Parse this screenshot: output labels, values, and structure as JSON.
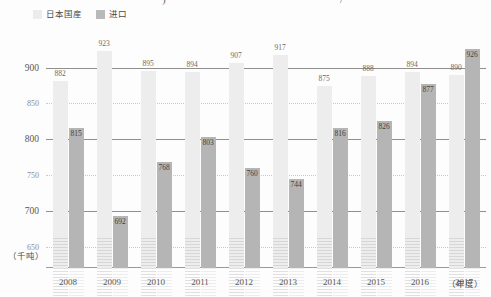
{
  "title_fragments": {
    "left": ")",
    "right": "/"
  },
  "legend": {
    "position": "top-left",
    "items": [
      {
        "label": "日本国産",
        "color": "#ececec",
        "key": "domestic"
      },
      {
        "label": "进口",
        "color": "#b9b9b9",
        "key": "import"
      }
    ]
  },
  "units": {
    "y": "（千吨）",
    "x": "（年度）"
  },
  "chart_data": {
    "type": "bar",
    "title": "",
    "subtitle": "",
    "xlabel": "（年度）",
    "ylabel": "（千吨）",
    "ylim": [
      620,
      940
    ],
    "yticks": [
      900,
      850,
      800,
      750,
      700,
      650
    ],
    "ytick_labels": [
      "900",
      "850",
      "800",
      "750",
      "700",
      "650"
    ],
    "gridlines": {
      "solid": [
        900,
        800,
        700
      ],
      "dotted": [
        850,
        750,
        650
      ]
    },
    "grid": true,
    "legend_position": "top-left",
    "categories": [
      "2008",
      "2009",
      "2010",
      "2011",
      "2012",
      "2013",
      "2014",
      "2015",
      "2016",
      "2017"
    ],
    "series": [
      {
        "name": "日本国産",
        "color": "#ededed",
        "values": [
          882,
          923,
          895,
          894,
          907,
          917,
          875,
          888,
          894,
          890
        ]
      },
      {
        "name": "进口",
        "color": "#b5b5b5",
        "values": [
          815,
          692,
          768,
          803,
          760,
          744,
          816,
          826,
          877,
          926
        ]
      }
    ]
  }
}
